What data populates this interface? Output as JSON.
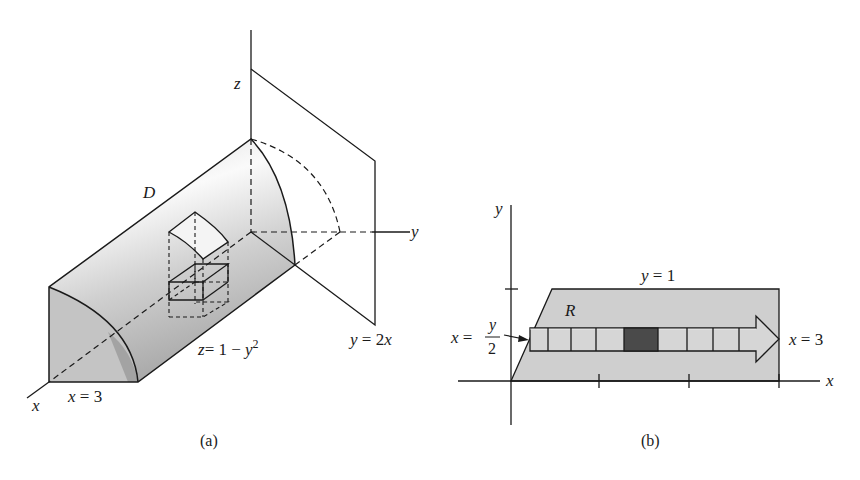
{
  "figure_a": {
    "caption": "(a)",
    "labels": {
      "z_axis": "z",
      "y_axis": "y",
      "x_axis": "x",
      "solid": "D",
      "surface_z": "z",
      "surface_eq": "= 1 − ",
      "surface_y": "y",
      "surface_exp": "2",
      "plane_y": "y",
      "plane_eq": " = 2",
      "plane_x": "x",
      "bound_x": "x",
      "bound_eq": " = 3"
    },
    "colors": {
      "solid_fill_light": "#f2f2f2",
      "solid_fill_dark": "#b8b8b8",
      "face_fill": "#c9c9c9",
      "line": "#1a1a1a"
    }
  },
  "figure_b": {
    "caption": "(b)",
    "labels": {
      "y_axis": "y",
      "x_axis": "x",
      "region": "R",
      "top_y": "y",
      "top_eq": " = 1",
      "right_x": "x",
      "right_eq": " = 3",
      "left_x": "x",
      "left_eq": " = ",
      "left_num": "y",
      "left_den": "2"
    },
    "x_ticks": [
      1,
      2,
      3
    ],
    "y_ticks": [
      1
    ],
    "strip_cells": 9,
    "highlighted_cell_index": 4,
    "colors": {
      "region_fill": "#cfcfcf",
      "highlight_cell": "#4a4a4a",
      "line": "#1a1a1a"
    }
  }
}
